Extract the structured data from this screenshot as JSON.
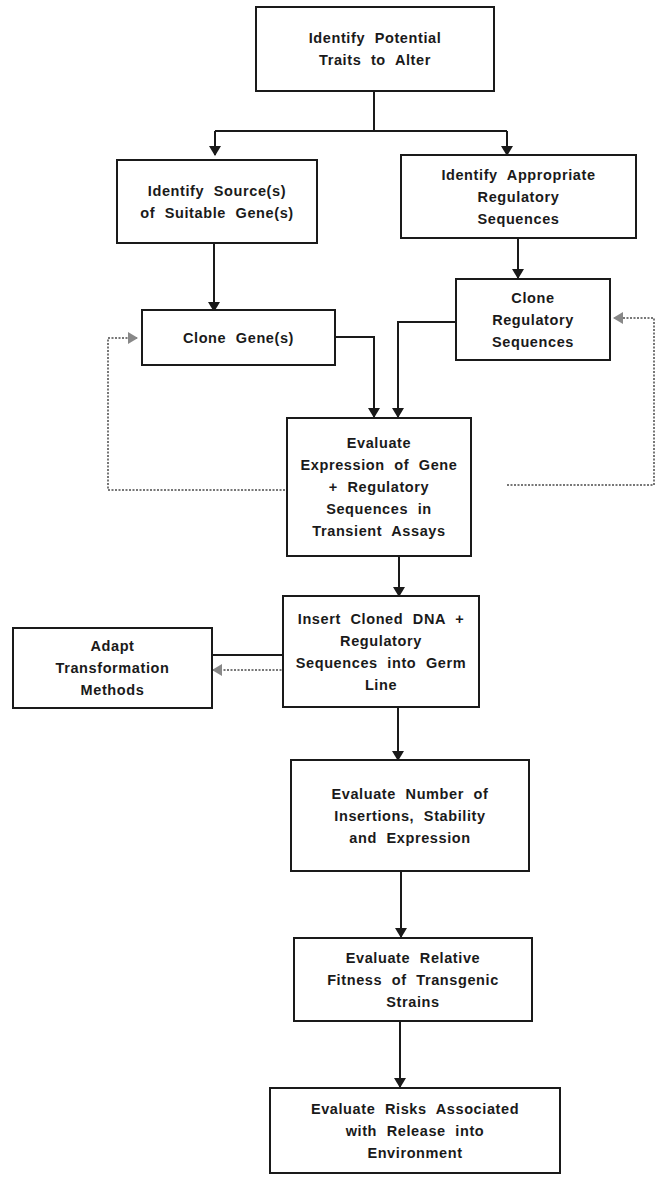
{
  "diagram": {
    "type": "flowchart",
    "nodes": [
      {
        "id": "identify-traits",
        "label": "Identify Potential\nTraits to Alter"
      },
      {
        "id": "identify-sources",
        "label": "Identify Source(s)\nof Suitable Gene(s)"
      },
      {
        "id": "identify-regulatory",
        "label": "Identify Appropriate\nRegulatory\nSequences"
      },
      {
        "id": "clone-genes",
        "label": "Clone Gene(s)"
      },
      {
        "id": "clone-regulatory",
        "label": "Clone\nRegulatory\nSequences"
      },
      {
        "id": "evaluate-expression",
        "label": "Evaluate\nExpression of Gene\n+ Regulatory\nSequences in\nTransient Assays"
      },
      {
        "id": "insert-dna",
        "label": "Insert Cloned DNA +\nRegulatory\nSequences into Germ\nLine"
      },
      {
        "id": "adapt-methods",
        "label": "Adapt\nTransformation\nMethods"
      },
      {
        "id": "evaluate-insertions",
        "label": "Evaluate Number of\nInsertions, Stability\nand Expression"
      },
      {
        "id": "evaluate-fitness",
        "label": "Evaluate Relative\nFitness of Transgenic\nStrains"
      },
      {
        "id": "evaluate-risks",
        "label": "Evaluate Risks Associated\nwith Release into\nEnvironment"
      }
    ],
    "edges": [
      {
        "from": "identify-traits",
        "to": "identify-sources",
        "style": "solid"
      },
      {
        "from": "identify-traits",
        "to": "identify-regulatory",
        "style": "solid"
      },
      {
        "from": "identify-sources",
        "to": "clone-genes",
        "style": "solid"
      },
      {
        "from": "identify-regulatory",
        "to": "clone-regulatory",
        "style": "solid"
      },
      {
        "from": "clone-genes",
        "to": "evaluate-expression",
        "style": "solid"
      },
      {
        "from": "clone-regulatory",
        "to": "evaluate-expression",
        "style": "solid"
      },
      {
        "from": "evaluate-expression",
        "to": "clone-genes",
        "style": "dotted"
      },
      {
        "from": "evaluate-expression",
        "to": "clone-regulatory",
        "style": "dotted"
      },
      {
        "from": "evaluate-expression",
        "to": "insert-dna",
        "style": "solid"
      },
      {
        "from": "adapt-methods",
        "to": "insert-dna",
        "style": "solid"
      },
      {
        "from": "insert-dna",
        "to": "adapt-methods",
        "style": "dotted"
      },
      {
        "from": "insert-dna",
        "to": "evaluate-insertions",
        "style": "solid"
      },
      {
        "from": "evaluate-insertions",
        "to": "evaluate-fitness",
        "style": "solid"
      },
      {
        "from": "evaluate-fitness",
        "to": "evaluate-risks",
        "style": "solid"
      }
    ]
  }
}
